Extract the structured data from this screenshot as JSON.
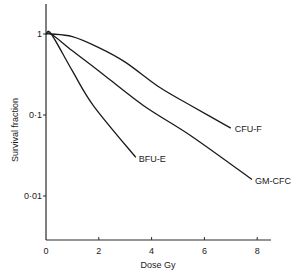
{
  "chart_data": {
    "type": "line",
    "title": "",
    "xlabel": "Dose Gy",
    "ylabel": "Survival fraction",
    "xlim": [
      0,
      8.5
    ],
    "ylim": [
      0.003,
      2.2
    ],
    "yscale": "log",
    "grid": false,
    "legend": "inline-labels",
    "x_ticks": [
      0,
      2,
      4,
      6,
      8
    ],
    "x_tick_labels": [
      "0",
      "2",
      "4",
      "6",
      "8"
    ],
    "y_ticks": [
      1,
      0.1,
      0.01
    ],
    "y_tick_labels": [
      "1",
      "0·1",
      "0·01"
    ],
    "series": [
      {
        "name": "CFU-F",
        "label": "CFU-F",
        "x": [
          0.2,
          1.0,
          2.0,
          3.0,
          4.3,
          5.5,
          7.0
        ],
        "y": [
          1.0,
          0.93,
          0.68,
          0.45,
          0.22,
          0.13,
          0.069
        ]
      },
      {
        "name": "GM-CFC",
        "label": "GM-CFC",
        "x": [
          0.2,
          1.0,
          2.0,
          3.7,
          5.5,
          7.8
        ],
        "y": [
          1.0,
          0.62,
          0.35,
          0.13,
          0.055,
          0.016
        ]
      },
      {
        "name": "BFU-E",
        "label": "BFU-E",
        "x": [
          0.2,
          1.0,
          1.8,
          3.4
        ],
        "y": [
          1.0,
          0.35,
          0.13,
          0.03
        ]
      }
    ]
  }
}
